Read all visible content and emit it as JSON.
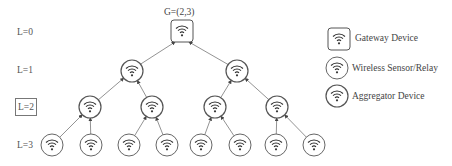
{
  "diagram": {
    "gateway_label": "G=(2,3)",
    "levels": [
      {
        "label": "L=0",
        "highlighted": false
      },
      {
        "label": "L=1",
        "highlighted": false
      },
      {
        "label": "L=2",
        "highlighted": true
      },
      {
        "label": "L=3",
        "highlighted": false
      }
    ],
    "nodes": [
      {
        "id": "g",
        "type": "gateway",
        "level": 0
      },
      {
        "id": "a1",
        "type": "aggregator",
        "level": 1,
        "parent": "g"
      },
      {
        "id": "a2",
        "type": "aggregator",
        "level": 1,
        "parent": "g"
      },
      {
        "id": "b1",
        "type": "aggregator",
        "level": 2,
        "parent": "a1"
      },
      {
        "id": "b2",
        "type": "aggregator",
        "level": 2,
        "parent": "a1"
      },
      {
        "id": "b3",
        "type": "aggregator",
        "level": 2,
        "parent": "a2"
      },
      {
        "id": "b4",
        "type": "aggregator",
        "level": 2,
        "parent": "a2"
      },
      {
        "id": "s1",
        "type": "sensor",
        "level": 3,
        "parent": "b1"
      },
      {
        "id": "s2",
        "type": "sensor",
        "level": 3,
        "parent": "b1"
      },
      {
        "id": "s3",
        "type": "sensor",
        "level": 3,
        "parent": "b2"
      },
      {
        "id": "s4",
        "type": "sensor",
        "level": 3,
        "parent": "b2"
      },
      {
        "id": "s5",
        "type": "sensor",
        "level": 3,
        "parent": "b3"
      },
      {
        "id": "s6",
        "type": "sensor",
        "level": 3,
        "parent": "b3"
      },
      {
        "id": "s7",
        "type": "sensor",
        "level": 3,
        "parent": "b4"
      },
      {
        "id": "s8",
        "type": "sensor",
        "level": 3,
        "parent": "b4"
      }
    ],
    "legend": [
      {
        "type": "gateway",
        "label": "Gateway Device",
        "icon": "wifi-square-icon"
      },
      {
        "type": "sensor",
        "label": "Wireless Sensor/Relay",
        "icon": "wifi-circle-icon"
      },
      {
        "type": "aggregator",
        "label": "Aggregator Device",
        "icon": "wifi-circle-bold-icon"
      }
    ],
    "colors": {
      "stroke": "#555555",
      "edge": "#777777",
      "text": "#444444"
    }
  }
}
